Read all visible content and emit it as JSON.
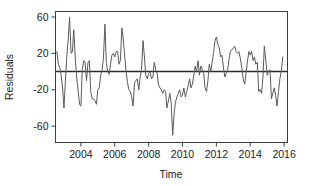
{
  "chart_data": {
    "type": "line",
    "title": "",
    "xlabel": "Time",
    "ylabel": "Residuals",
    "xlim": [
      2002.5,
      2016.2
    ],
    "ylim": [
      -78,
      66
    ],
    "grid": false,
    "legend": null,
    "xticks": [
      2004,
      2006,
      2008,
      2010,
      2012,
      2014,
      2016
    ],
    "xtick_labels": [
      "2004",
      "2006",
      "2008",
      "2010",
      "2012",
      "2014",
      "2016"
    ],
    "yticks": [
      60,
      20,
      -20,
      -60
    ],
    "ytick_labels": [
      "60",
      "20",
      "-20",
      "-60"
    ],
    "reference_line": {
      "y": 0,
      "orientation": "horizontal",
      "color": "#2b2b2b"
    },
    "series": [
      {
        "name": "Residuals",
        "color": "#5a5a5a",
        "x": [
          2002.58,
          2002.67,
          2002.75,
          2002.83,
          2002.92,
          2003.0,
          2003.08,
          2003.17,
          2003.25,
          2003.33,
          2003.42,
          2003.5,
          2003.58,
          2003.67,
          2003.75,
          2003.83,
          2003.92,
          2004.0,
          2004.08,
          2004.17,
          2004.25,
          2004.33,
          2004.42,
          2004.5,
          2004.58,
          2004.67,
          2004.75,
          2004.83,
          2004.92,
          2005.0,
          2005.08,
          2005.17,
          2005.25,
          2005.33,
          2005.42,
          2005.5,
          2005.58,
          2005.67,
          2005.75,
          2005.83,
          2005.92,
          2006.0,
          2006.08,
          2006.17,
          2006.25,
          2006.33,
          2006.42,
          2006.5,
          2006.58,
          2006.67,
          2006.75,
          2006.83,
          2006.92,
          2007.0,
          2007.08,
          2007.17,
          2007.25,
          2007.33,
          2007.42,
          2007.5,
          2007.58,
          2007.67,
          2007.75,
          2007.83,
          2007.92,
          2008.0,
          2008.08,
          2008.17,
          2008.25,
          2008.33,
          2008.42,
          2008.5,
          2008.58,
          2008.67,
          2008.75,
          2008.83,
          2008.92,
          2009.0,
          2009.08,
          2009.17,
          2009.25,
          2009.33,
          2009.42,
          2009.5,
          2009.58,
          2009.67,
          2009.75,
          2009.83,
          2009.92,
          2010.0,
          2010.08,
          2010.17,
          2010.25,
          2010.33,
          2010.42,
          2010.5,
          2010.58,
          2010.67,
          2010.75,
          2010.83,
          2010.92,
          2011.0,
          2011.08,
          2011.17,
          2011.25,
          2011.33,
          2011.42,
          2011.5,
          2011.58,
          2011.67,
          2011.75,
          2011.83,
          2011.92,
          2012.0,
          2012.08,
          2012.17,
          2012.25,
          2012.33,
          2012.42,
          2012.5,
          2012.58,
          2012.67,
          2012.75,
          2012.83,
          2012.92,
          2013.0,
          2013.08,
          2013.17,
          2013.25,
          2013.33,
          2013.42,
          2013.5,
          2013.58,
          2013.67,
          2013.75,
          2013.83,
          2013.92,
          2014.0,
          2014.08,
          2014.17,
          2014.25,
          2014.33,
          2014.42,
          2014.5,
          2014.58,
          2014.67,
          2014.75,
          2014.83,
          2014.92,
          2015.0,
          2015.08,
          2015.17,
          2015.25,
          2015.33,
          2015.42,
          2015.5,
          2015.58,
          2015.67,
          2015.75,
          2015.83,
          2015.92
        ],
        "values": [
          22,
          8,
          5,
          -4,
          -18,
          -40,
          -12,
          18,
          35,
          60,
          20,
          22,
          46,
          14,
          -6,
          -20,
          -36,
          -38,
          2,
          12,
          10,
          -10,
          10,
          12,
          -22,
          -30,
          -30,
          -32,
          -36,
          -20,
          -18,
          -4,
          2,
          14,
          52,
          10,
          0,
          -3,
          8,
          18,
          20,
          16,
          22,
          22,
          8,
          12,
          48,
          36,
          18,
          0,
          -12,
          -20,
          -22,
          -28,
          -38,
          -12,
          -10,
          -8,
          -20,
          -6,
          2,
          34,
          16,
          -4,
          -8,
          -2,
          0,
          -8,
          -6,
          10,
          2,
          -2,
          -14,
          -18,
          -20,
          -24,
          -20,
          -22,
          -40,
          -32,
          -24,
          -34,
          -70,
          -48,
          -34,
          -28,
          -24,
          -20,
          -28,
          -26,
          -18,
          -28,
          -22,
          -16,
          -8,
          -18,
          -14,
          -4,
          6,
          0,
          12,
          -4,
          6,
          2,
          -2,
          -18,
          -22,
          -10,
          8,
          0,
          10,
          20,
          34,
          38,
          30,
          26,
          16,
          18,
          4,
          -6,
          -2,
          2,
          14,
          22,
          24,
          26,
          28,
          22,
          20,
          22,
          14,
          4,
          -8,
          -14,
          -2,
          10,
          22,
          18,
          22,
          12,
          16,
          8,
          10,
          -22,
          -20,
          -24,
          -6,
          28,
          12,
          -4,
          0,
          2,
          -30,
          -24,
          -18,
          -26,
          -38,
          -22,
          -8,
          0,
          16
        ]
      }
    ]
  }
}
